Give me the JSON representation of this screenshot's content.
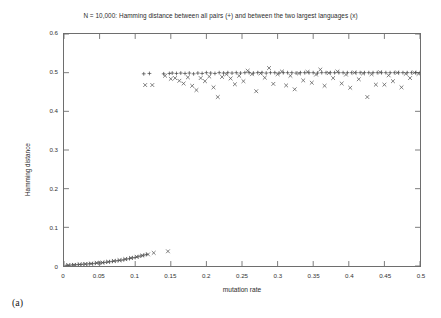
{
  "figure": {
    "panel_label": "(a)",
    "background": "#ffffff",
    "frame_color": "#6e6e6e"
  },
  "chart_data": {
    "type": "scatter",
    "title": "N = 10,000: Hamming distance between all pairs (+) and between the two largest languages (x)",
    "xlabel": "mutation rate",
    "ylabel": "Hamming distance",
    "xlim": [
      0,
      0.5
    ],
    "ylim": [
      0,
      0.6
    ],
    "grid": false,
    "legend_position": "none",
    "xticks": [
      0,
      0.05,
      0.1,
      0.15,
      0.2,
      0.25,
      0.3,
      0.35,
      0.4,
      0.45,
      0.5
    ],
    "xtick_labels": [
      "0",
      "0.05",
      "0.1",
      "0.15",
      "0.2",
      "0.25",
      "0.3",
      "0.35",
      "0.4",
      "0.45",
      "0.5"
    ],
    "yticks": [
      0,
      0.1,
      0.2,
      0.3,
      0.4,
      0.5,
      0.6
    ],
    "ytick_labels": [
      "0",
      "0.1",
      "0.2",
      "0.3",
      "0.4",
      "0.5",
      "0.6"
    ],
    "series": [
      {
        "name": "Hamming distance between all pairs",
        "marker": "plus",
        "color": "#4a4a4a",
        "points": [
          [
            0.004,
            0.002
          ],
          [
            0.008,
            0.002
          ],
          [
            0.012,
            0.003
          ],
          [
            0.016,
            0.003
          ],
          [
            0.02,
            0.004
          ],
          [
            0.024,
            0.004
          ],
          [
            0.028,
            0.005
          ],
          [
            0.032,
            0.005
          ],
          [
            0.036,
            0.006
          ],
          [
            0.04,
            0.006
          ],
          [
            0.044,
            0.007
          ],
          [
            0.048,
            0.008
          ],
          [
            0.052,
            0.008
          ],
          [
            0.056,
            0.009
          ],
          [
            0.06,
            0.01
          ],
          [
            0.064,
            0.011
          ],
          [
            0.068,
            0.012
          ],
          [
            0.072,
            0.013
          ],
          [
            0.076,
            0.014
          ],
          [
            0.08,
            0.015
          ],
          [
            0.084,
            0.016
          ],
          [
            0.088,
            0.018
          ],
          [
            0.092,
            0.019
          ],
          [
            0.096,
            0.021
          ],
          [
            0.1,
            0.022
          ],
          [
            0.104,
            0.024
          ],
          [
            0.108,
            0.026
          ],
          [
            0.112,
            0.028
          ],
          [
            0.116,
            0.03
          ],
          [
            0.112,
            0.497
          ],
          [
            0.12,
            0.498
          ],
          [
            0.14,
            0.497
          ],
          [
            0.148,
            0.498
          ],
          [
            0.152,
            0.499
          ],
          [
            0.158,
            0.498
          ],
          [
            0.164,
            0.499
          ],
          [
            0.17,
            0.498
          ],
          [
            0.176,
            0.499
          ],
          [
            0.182,
            0.497
          ],
          [
            0.188,
            0.499
          ],
          [
            0.194,
            0.498
          ],
          [
            0.2,
            0.5
          ],
          [
            0.206,
            0.499
          ],
          [
            0.212,
            0.498
          ],
          [
            0.218,
            0.5
          ],
          [
            0.224,
            0.499
          ],
          [
            0.23,
            0.5
          ],
          [
            0.236,
            0.499
          ],
          [
            0.242,
            0.5
          ],
          [
            0.248,
            0.499
          ],
          [
            0.254,
            0.5
          ],
          [
            0.26,
            0.5
          ],
          [
            0.266,
            0.499
          ],
          [
            0.272,
            0.5
          ],
          [
            0.278,
            0.5
          ],
          [
            0.284,
            0.499
          ],
          [
            0.29,
            0.5
          ],
          [
            0.296,
            0.5
          ],
          [
            0.302,
            0.499
          ],
          [
            0.308,
            0.5
          ],
          [
            0.314,
            0.5
          ],
          [
            0.32,
            0.5
          ],
          [
            0.326,
            0.499
          ],
          [
            0.332,
            0.5
          ],
          [
            0.338,
            0.5
          ],
          [
            0.344,
            0.5
          ],
          [
            0.35,
            0.5
          ],
          [
            0.356,
            0.499
          ],
          [
            0.362,
            0.5
          ],
          [
            0.368,
            0.5
          ],
          [
            0.374,
            0.5
          ],
          [
            0.38,
            0.5
          ],
          [
            0.386,
            0.5
          ],
          [
            0.392,
            0.5
          ],
          [
            0.398,
            0.5
          ],
          [
            0.404,
            0.5
          ],
          [
            0.41,
            0.5
          ],
          [
            0.416,
            0.5
          ],
          [
            0.422,
            0.5
          ],
          [
            0.428,
            0.5
          ],
          [
            0.434,
            0.5
          ],
          [
            0.44,
            0.5
          ],
          [
            0.446,
            0.5
          ],
          [
            0.452,
            0.5
          ],
          [
            0.458,
            0.5
          ],
          [
            0.464,
            0.5
          ],
          [
            0.47,
            0.5
          ],
          [
            0.476,
            0.5
          ],
          [
            0.482,
            0.5
          ],
          [
            0.488,
            0.5
          ],
          [
            0.494,
            0.5
          ],
          [
            0.5,
            0.5
          ]
        ]
      },
      {
        "name": "Hamming distance between the two largest languages",
        "marker": "cross",
        "color": "#555555",
        "points": [
          [
            0.006,
            0.002
          ],
          [
            0.014,
            0.003
          ],
          [
            0.022,
            0.004
          ],
          [
            0.03,
            0.005
          ],
          [
            0.038,
            0.006
          ],
          [
            0.046,
            0.008
          ],
          [
            0.054,
            0.009
          ],
          [
            0.062,
            0.011
          ],
          [
            0.07,
            0.013
          ],
          [
            0.078,
            0.015
          ],
          [
            0.086,
            0.018
          ],
          [
            0.094,
            0.021
          ],
          [
            0.102,
            0.024
          ],
          [
            0.11,
            0.027
          ],
          [
            0.118,
            0.03
          ],
          [
            0.126,
            0.034
          ],
          [
            0.146,
            0.038
          ],
          [
            0.114,
            0.468
          ],
          [
            0.124,
            0.468
          ],
          [
            0.142,
            0.492
          ],
          [
            0.15,
            0.484
          ],
          [
            0.156,
            0.486
          ],
          [
            0.162,
            0.479
          ],
          [
            0.168,
            0.472
          ],
          [
            0.174,
            0.488
          ],
          [
            0.18,
            0.466
          ],
          [
            0.186,
            0.455
          ],
          [
            0.192,
            0.486
          ],
          [
            0.198,
            0.478
          ],
          [
            0.204,
            0.49
          ],
          [
            0.21,
            0.462
          ],
          [
            0.216,
            0.437
          ],
          [
            0.222,
            0.489
          ],
          [
            0.228,
            0.496
          ],
          [
            0.234,
            0.485
          ],
          [
            0.24,
            0.47
          ],
          [
            0.246,
            0.492
          ],
          [
            0.252,
            0.478
          ],
          [
            0.258,
            0.505
          ],
          [
            0.264,
            0.496
          ],
          [
            0.27,
            0.452
          ],
          [
            0.276,
            0.498
          ],
          [
            0.282,
            0.487
          ],
          [
            0.288,
            0.512
          ],
          [
            0.294,
            0.471
          ],
          [
            0.3,
            0.496
          ],
          [
            0.306,
            0.503
          ],
          [
            0.312,
            0.467
          ],
          [
            0.318,
            0.492
          ],
          [
            0.324,
            0.457
          ],
          [
            0.33,
            0.498
          ],
          [
            0.336,
            0.48
          ],
          [
            0.342,
            0.502
          ],
          [
            0.348,
            0.474
          ],
          [
            0.354,
            0.495
          ],
          [
            0.36,
            0.508
          ],
          [
            0.366,
            0.466
          ],
          [
            0.372,
            0.499
          ],
          [
            0.378,
            0.486
          ],
          [
            0.384,
            0.503
          ],
          [
            0.39,
            0.472
          ],
          [
            0.396,
            0.495
          ],
          [
            0.402,
            0.461
          ],
          [
            0.408,
            0.5
          ],
          [
            0.414,
            0.483
          ],
          [
            0.42,
            0.498
          ],
          [
            0.426,
            0.437
          ],
          [
            0.432,
            0.496
          ],
          [
            0.438,
            0.469
          ],
          [
            0.444,
            0.501
          ],
          [
            0.45,
            0.469
          ],
          [
            0.456,
            0.493
          ],
          [
            0.462,
            0.478
          ],
          [
            0.468,
            0.5
          ],
          [
            0.474,
            0.462
          ],
          [
            0.48,
            0.497
          ],
          [
            0.486,
            0.486
          ],
          [
            0.492,
            0.5
          ],
          [
            0.498,
            0.497
          ]
        ]
      }
    ]
  }
}
